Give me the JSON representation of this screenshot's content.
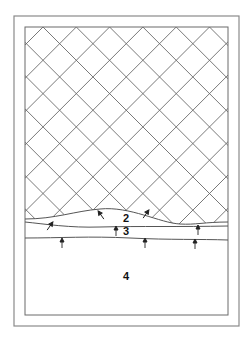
{
  "diagram": {
    "type": "layered cross-section with lattice",
    "colors": {
      "line": "#6a6a6a",
      "frame": "#8a8a8a",
      "text": "#111111",
      "background": "#ffffff"
    },
    "frame": {
      "outer": {
        "x": 14,
        "y": 16,
        "w": 225,
        "h": 310
      },
      "inner": {
        "x": 25,
        "y": 27,
        "w": 203,
        "h": 288
      }
    },
    "lattice": {
      "spacing": 33.3,
      "origin_x": 43,
      "top_y": 27
    },
    "layers": [
      {
        "id": "1",
        "label": "",
        "description": "diagonal lattice region"
      },
      {
        "id": "2",
        "label": "2",
        "x": 126,
        "y": 218
      },
      {
        "id": "3",
        "label": "3",
        "x": 126,
        "y": 231
      },
      {
        "id": "4",
        "label": "4",
        "x": 126,
        "y": 276
      }
    ],
    "arrows": [
      {
        "x": 50,
        "y": 226,
        "dir": "up-right"
      },
      {
        "x": 101,
        "y": 215,
        "dir": "up-left"
      },
      {
        "x": 146,
        "y": 214,
        "dir": "up-right"
      },
      {
        "x": 198,
        "y": 230,
        "dir": "up"
      },
      {
        "x": 62,
        "y": 243,
        "dir": "up"
      },
      {
        "x": 116,
        "y": 231,
        "dir": "up"
      },
      {
        "x": 145,
        "y": 243,
        "dir": "up"
      },
      {
        "x": 195,
        "y": 244,
        "dir": "up"
      }
    ]
  }
}
